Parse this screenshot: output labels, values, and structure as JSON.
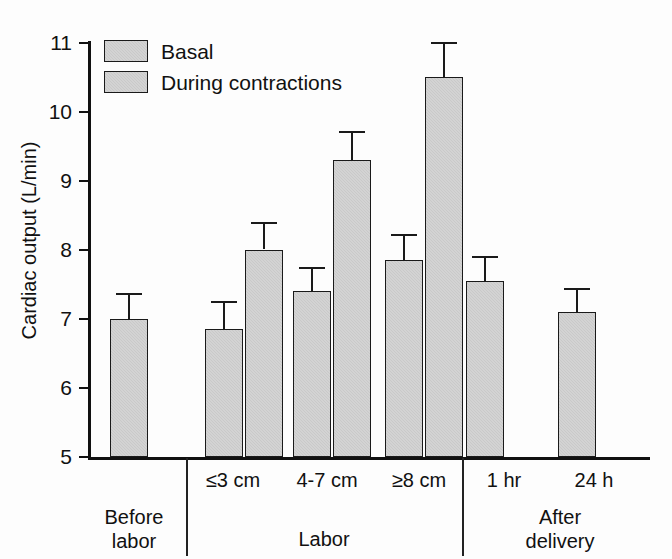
{
  "chart_data": {
    "type": "bar",
    "title": "",
    "xlabel": "",
    "ylabel": "Cardiac output (L/min)",
    "ylim": [
      5,
      11
    ],
    "yticks": [
      5,
      6,
      7,
      8,
      9,
      10,
      11
    ],
    "grid": false,
    "legend_position": "top-left",
    "legend": [
      "Basal",
      "During contractions"
    ],
    "categories": [
      "Before labor",
      "≤3 cm",
      "4-7 cm",
      "≥8 cm",
      "1 hr",
      "24 h"
    ],
    "group_labels": [
      "Before labor",
      "Labor",
      "After delivery"
    ],
    "series": [
      {
        "name": "Basal",
        "values": [
          7.0,
          6.85,
          7.4,
          7.85,
          7.55,
          7.1
        ],
        "errors_upper": [
          7.37,
          7.25,
          7.75,
          8.22,
          7.9,
          7.45
        ]
      },
      {
        "name": "During contractions",
        "values": [
          null,
          8.0,
          9.3,
          10.5,
          null,
          null
        ],
        "errors_upper": [
          null,
          8.4,
          9.72,
          11.0,
          null,
          null
        ]
      }
    ],
    "bar_fill_color": "#c9c9c9",
    "bar_edge_color": "#1a1a1a",
    "axis_color": "#111111",
    "background_color": "#ffffff"
  },
  "axis": {
    "y_title": "Cardiac output (L/min)",
    "ticks": [
      {
        "label": "11"
      },
      {
        "label": "10"
      },
      {
        "label": "9"
      },
      {
        "label": "8"
      },
      {
        "label": "7"
      },
      {
        "label": "6"
      },
      {
        "label": "5"
      }
    ]
  },
  "legend": {
    "items": [
      {
        "label": "Basal"
      },
      {
        "label": "During contractions"
      }
    ]
  },
  "x_labels": {
    "tier1": [
      {
        "label": "≤3 cm"
      },
      {
        "label": "4-7 cm"
      },
      {
        "label": "≥8 cm"
      },
      {
        "label": "1 hr"
      },
      {
        "label": "24 h"
      }
    ],
    "tier2": [
      {
        "label": "Before",
        "label2": "labor"
      },
      {
        "label": "Labor",
        "label2": ""
      },
      {
        "label": "After",
        "label2": "delivery"
      }
    ]
  }
}
